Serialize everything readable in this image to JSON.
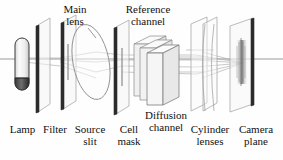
{
  "figure": {
    "background_color": "#fefefe",
    "ink_color": "#111111",
    "plate_edge_color": "#2b2b2b",
    "ray_color": "#8c8c8c",
    "axis_color": "#9a9a9a",
    "glass_fill": "#f2f2f2"
  },
  "labels": {
    "top": [
      {
        "id": "main-lens",
        "line1": "Main",
        "line2": "lens"
      },
      {
        "id": "reference-channel",
        "line1": "Reference",
        "line2": "channel"
      }
    ],
    "bottom": [
      {
        "id": "lamp",
        "line1": "Lamp",
        "line2": ""
      },
      {
        "id": "filter",
        "line1": "Filter",
        "line2": ""
      },
      {
        "id": "source-slit",
        "line1": "Source",
        "line2": "slit"
      },
      {
        "id": "cell-mask",
        "line1": "Cell",
        "line2": "mask"
      },
      {
        "id": "diffusion-channel",
        "line1": "Diffusion",
        "line2": "channel"
      },
      {
        "id": "cylinder-lenses",
        "line1": "Cylinder",
        "line2": "lenses"
      },
      {
        "id": "camera-plane",
        "line1": "Camera",
        "line2": "plane"
      }
    ]
  },
  "components": {
    "lamp": "lamp-capsule",
    "filter": "filter-plate",
    "source_slit": "source-slit-plate",
    "main_lens": "main-lens-ellipse",
    "cell_mask": "cell-mask-plate",
    "reference_channel": "reference-channel-box",
    "diffusion_channel": "diffusion-channel-box",
    "cylinder_lenses": "cylinder-lens-plate-pair",
    "camera_plane": "camera-plane-plate",
    "optical_axis": "optical-axis-line",
    "rays": "light-ray-bundle"
  }
}
